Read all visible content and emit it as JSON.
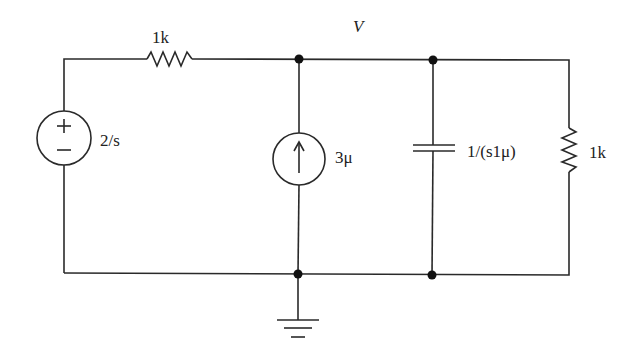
{
  "diagram": {
    "type": "circuit-schematic",
    "node_label": "V",
    "components": {
      "series_resistor": {
        "label": "1k"
      },
      "voltage_source": {
        "label": "2/s",
        "plus": "+",
        "minus": "−"
      },
      "current_source": {
        "label": "3μ",
        "direction": "up"
      },
      "capacitor": {
        "label": "1/(s1μ)"
      },
      "shunt_resistor": {
        "label": "1k"
      }
    },
    "ground": "ground-symbol"
  }
}
